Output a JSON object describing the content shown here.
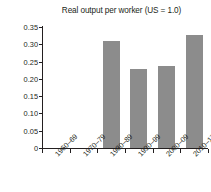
{
  "chart_data": {
    "type": "bar",
    "title": "Real output per worker (US = 1.0)",
    "xlabel": "",
    "ylabel": "Ratio relative to the United States",
    "categories": [
      "1960–69",
      "1970–79",
      "1980–89",
      "1990–99",
      "2000–09",
      "2010–17"
    ],
    "values": [
      0,
      0,
      0.31,
      0.228,
      0.236,
      0.327
    ],
    "ylim": [
      0,
      0.35
    ],
    "yticks": [
      0,
      0.05,
      0.1,
      0.15,
      0.2,
      0.25,
      0.3,
      0.35
    ],
    "ytick_labels": [
      "0",
      "0.05",
      "0.10",
      "0.15",
      "0.20",
      "0.25",
      "0.30",
      "0.35"
    ],
    "grid": false,
    "legend": null,
    "bar_color": "#8c8c8c",
    "axis_color": "#231f20",
    "background": "#ffffff"
  }
}
